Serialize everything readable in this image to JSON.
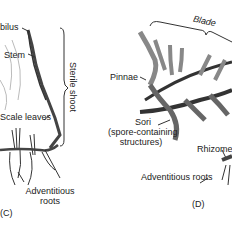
{
  "panel_c": {
    "id_label": "(C)",
    "labels": {
      "umbilus": "bilus",
      "stem": "Stem",
      "scale_leaves": "Scale leaves",
      "adventitious_roots_line1": "Adventitious",
      "adventitious_roots_line2": "roots",
      "sterile_shoot": "Sterile shoot"
    }
  },
  "panel_d": {
    "id_label": "(D)",
    "labels": {
      "blade": "Blade",
      "pinnae": "Pinnae",
      "sori": "Sori",
      "sori_desc_line1": "(spore-containing",
      "sori_desc_line2": "structures)",
      "rhizome": "Rhizome",
      "adventitious_roots": "Adventitious roots"
    }
  }
}
